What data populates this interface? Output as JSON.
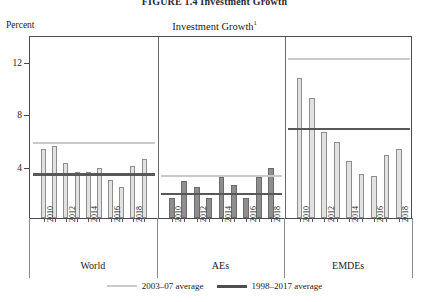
{
  "figure": {
    "heading": "FIGURE 1.4 Investment Growth",
    "unit_label": "Percent",
    "panel_title": "Investment Growth",
    "panel_title_superscript": "1"
  },
  "axis": {
    "y_ticks": [
      "12",
      "8",
      "4"
    ],
    "x_year_labels": [
      "2010",
      "2012",
      "2014",
      "2016",
      "2018"
    ]
  },
  "groups": [
    {
      "label": "World"
    },
    {
      "label": "AEs"
    },
    {
      "label": "EMDEs"
    }
  ],
  "legend": [
    {
      "label": "2003–07 average",
      "color": "#c9c9c9"
    },
    {
      "label": "1998–2017 average",
      "color": "#4e4e4e"
    }
  ],
  "chart_data": {
    "type": "bar",
    "title": "Investment Growth",
    "xlabel": "",
    "ylabel": "Percent",
    "ylim": [
      0,
      14
    ],
    "yticks": [
      4,
      8,
      12
    ],
    "grid": false,
    "legend_position": "bottom",
    "x": [
      2010,
      2011,
      2012,
      2013,
      2014,
      2015,
      2016,
      2017,
      2018
    ],
    "panels": [
      {
        "name": "World",
        "bar_style": "light",
        "values": [
          5.3,
          5.5,
          4.2,
          3.5,
          3.5,
          3.8,
          2.9,
          2.4,
          4.0
        ],
        "extra_value": 4.5,
        "reference_lines": [
          {
            "name": "2003–07 average",
            "value": 5.9,
            "color": "#c9c9c9"
          },
          {
            "name": "1998–2017 average",
            "value": 3.5,
            "color": "#585858"
          }
        ]
      },
      {
        "name": "AEs",
        "bar_style": "dark",
        "values": [
          1.5,
          2.8,
          2.4,
          1.5,
          3.1,
          2.5,
          1.5,
          3.1,
          3.8
        ],
        "reference_lines": [
          {
            "name": "2003–07 average",
            "value": 3.4,
            "color": "#c9c9c9"
          },
          {
            "name": "1998–2017 average",
            "value": 2.0,
            "color": "#585858"
          }
        ]
      },
      {
        "name": "EMDEs",
        "bar_style": "light",
        "values": [
          10.7,
          9.2,
          6.6,
          5.8,
          4.4,
          3.4,
          3.2,
          4.8,
          5.3
        ],
        "reference_lines": [
          {
            "name": "2003–07 average",
            "value": 12.3,
            "color": "#c9c9c9"
          },
          {
            "name": "1998–2017 average",
            "value": 7.0,
            "color": "#585858"
          }
        ]
      }
    ]
  }
}
